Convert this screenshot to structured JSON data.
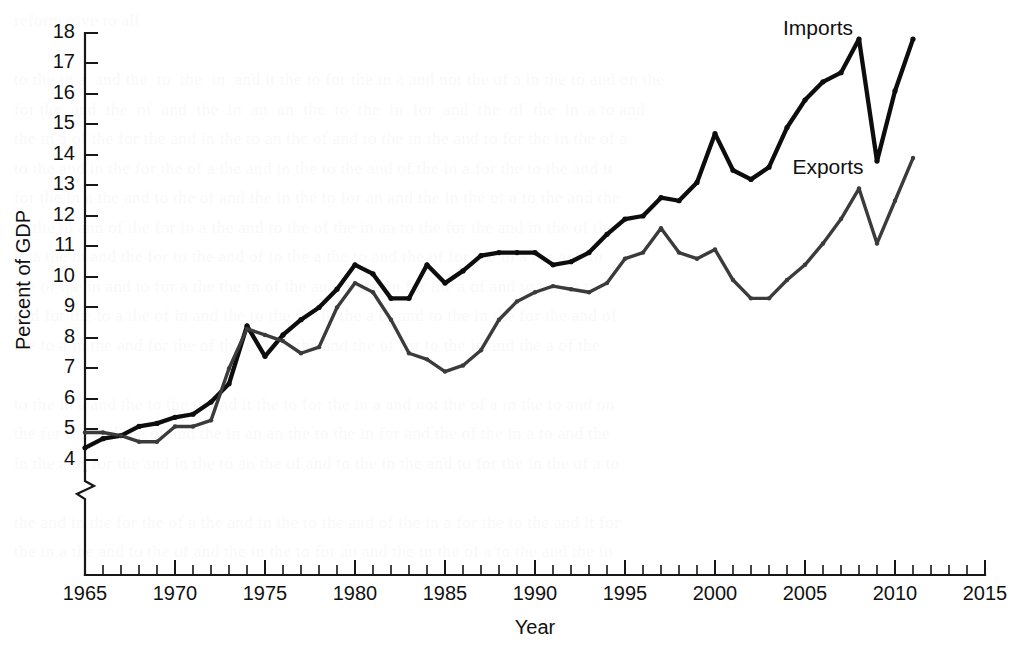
{
  "figure": {
    "background_color": "#ffffff",
    "ink_color": "#111111"
  },
  "axes": {
    "y_title": "Percent of GDP",
    "x_title": "Year",
    "y_tick_labels": [
      "4",
      "5",
      "6",
      "7",
      "8",
      "9",
      "10",
      "11",
      "12",
      "13",
      "14",
      "15",
      "16",
      "17",
      "18"
    ],
    "x_tick_labels": [
      "1965",
      "1970",
      "1975",
      "1980",
      "1985",
      "1990",
      "1995",
      "2000",
      "2005",
      "2010",
      "2015"
    ],
    "axis_break": true
  },
  "series_labels": {
    "imports": "Imports",
    "exports": "Exports"
  },
  "colors": {
    "imports": "#0d0d0d",
    "exports": "#3b3b3b",
    "axis": "#171717"
  },
  "chart_data": {
    "type": "line",
    "title": "",
    "subtitle": "",
    "xlabel": "Year",
    "ylabel": "Percent of GDP",
    "xlim": [
      1965,
      2015
    ],
    "ylim": [
      4,
      18
    ],
    "y_break_below": 4,
    "grid": false,
    "legend_position": "inline-annotation",
    "x_major_tick_step": 5,
    "x_minor_tick_step": 1,
    "y_major_tick_step": 1,
    "annotations": [
      {
        "text": "Imports",
        "x": 2007,
        "y": 18.3
      },
      {
        "text": "Exports",
        "x": 2007,
        "y": 13.7
      }
    ],
    "x": [
      1965,
      1966,
      1967,
      1968,
      1969,
      1970,
      1971,
      1972,
      1973,
      1974,
      1975,
      1976,
      1977,
      1978,
      1979,
      1980,
      1981,
      1982,
      1983,
      1984,
      1985,
      1986,
      1987,
      1988,
      1989,
      1990,
      1991,
      1992,
      1993,
      1994,
      1995,
      1996,
      1997,
      1998,
      1999,
      2000,
      2001,
      2002,
      2003,
      2004,
      2005,
      2006,
      2007,
      2008,
      2009,
      2010,
      2011
    ],
    "series": [
      {
        "name": "Imports",
        "values": [
          4.4,
          4.7,
          4.8,
          5.1,
          5.2,
          5.4,
          5.5,
          5.9,
          6.5,
          8.4,
          7.4,
          8.1,
          8.6,
          9.0,
          9.6,
          10.4,
          10.1,
          9.3,
          9.3,
          10.4,
          9.8,
          10.2,
          10.7,
          10.8,
          10.8,
          10.8,
          10.4,
          10.5,
          10.8,
          11.4,
          11.9,
          12.0,
          12.6,
          12.5,
          13.1,
          14.7,
          13.5,
          13.2,
          13.6,
          14.9,
          15.8,
          16.4,
          16.7,
          17.8,
          13.8,
          16.1,
          17.8
        ]
      },
      {
        "name": "Exports",
        "values": [
          4.9,
          4.9,
          4.8,
          4.6,
          4.6,
          5.1,
          5.1,
          5.3,
          7.0,
          8.3,
          8.1,
          7.9,
          7.5,
          7.7,
          9.0,
          9.8,
          9.5,
          8.6,
          7.5,
          7.3,
          6.9,
          7.1,
          7.6,
          8.6,
          9.2,
          9.5,
          9.7,
          9.6,
          9.5,
          9.8,
          10.6,
          10.8,
          11.6,
          10.8,
          10.6,
          10.9,
          9.9,
          9.3,
          9.3,
          9.9,
          10.4,
          11.1,
          11.9,
          12.9,
          11.1,
          12.5,
          13.9
        ]
      }
    ]
  },
  "bleed_text": "reform give to all\n\nto the in a  and the  to  the  in  and it the to for the in a and not the of a in the to and on the\nfor the  and  the  of  and  the  in  an  an  the  to  the  in  for  and  the  of  the  in  a to and\nthe in a of the for the and in the to an the of and to the in the and to for the in the of a\nto the and in the for the of a the and in the to the and of the in a for the to the and it\nfor the in a the and to the of and the in the to for an and the in the of a to the and the\nin the to and of the for in a the and to the of the in an to the for the and in the of the\nto a the in and the for to the and of in the a the to and the of for the in a the and to\nthe of the in and to for a the the in of the and to the in for the a of and to the in the\nand for the to a the of in and the to the for in the a of and to the in the for the and of\nthe to a in the and for the of the to in a the and the of for to the in and the a of the\n\nto the in a and the to the in and it the to for the in a and not the of a in the to and on\nthe for the and the of and the in an an the to the in for and the of the in a to and the\nin the a of for the and in the to an the of and to the in the and to for the in the of a to\n\nthe and in the for the of a the and in the to the and of the in a for the to the and it for\nthe in a the and to the of and the in the to for an and the in the of a to the and the in"
}
